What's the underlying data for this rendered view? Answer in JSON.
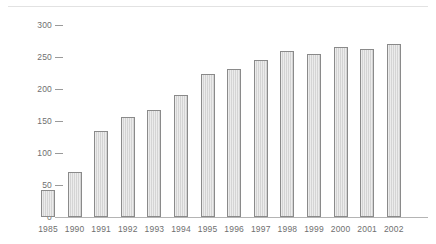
{
  "chart_data": {
    "type": "bar",
    "title": "",
    "subtitle": "",
    "xlabel": "",
    "ylabel": "",
    "categories": [
      "1985",
      "1990",
      "1991",
      "1992",
      "1993",
      "1994",
      "1995",
      "1996",
      "1997",
      "1998",
      "1999",
      "2000",
      "2001",
      "2002"
    ],
    "values": [
      42,
      70,
      135,
      157,
      167,
      191,
      223,
      232,
      245,
      259,
      254,
      265,
      263,
      271
    ],
    "ylim": [
      0,
      300
    ],
    "yticks": [
      0,
      50,
      100,
      150,
      200,
      250,
      300
    ],
    "ytick_labels": [
      "0",
      "50",
      "100",
      "150",
      "200",
      "250",
      "300"
    ],
    "grid": false,
    "legend": null,
    "legend_position": "none",
    "annotations": [],
    "series": [
      {
        "name": "",
        "values": [
          42,
          70,
          135,
          157,
          167,
          191,
          223,
          232,
          245,
          259,
          254,
          265,
          263,
          271
        ]
      }
    ]
  },
  "style": {
    "bar_fill": "#d4d4d4",
    "bar_stroke": "#8a8a8a",
    "axis_color": "#b4b4b4",
    "tick_color": "#9a9a9a",
    "text_color": "#6f6f6f",
    "background": "#ffffff",
    "rule_color": "#e2e2e2"
  }
}
